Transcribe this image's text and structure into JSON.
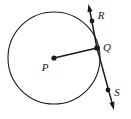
{
  "figure": {
    "name": "circle-with-tangent-line",
    "background_color": "#ffffff",
    "stroke_color": "#1a1a1a",
    "point_color": "#1a1a1a"
  },
  "circle": {
    "label": "circle-p",
    "center_x": 54,
    "center_y": 58,
    "radius": 46,
    "stroke_width": 1.1
  },
  "points": [
    {
      "id": "P",
      "label": "P",
      "role": "center",
      "x": 54,
      "y": 58,
      "label_x": 45,
      "label_y": 68,
      "dot_radius": 2.6
    },
    {
      "id": "Q",
      "label": "Q",
      "role": "point-of-tangency",
      "x": 97,
      "y": 48,
      "label_x": 107,
      "label_y": 48,
      "dot_radius": 2.8
    },
    {
      "id": "R",
      "label": "R",
      "role": "tangent-point-upper",
      "x": 92,
      "y": 21,
      "label_x": 101,
      "label_y": 16,
      "dot_radius": 2.4
    },
    {
      "id": "S",
      "label": "S",
      "role": "tangent-point-lower",
      "x": 108,
      "y": 90,
      "label_x": 117,
      "label_y": 93,
      "dot_radius": 2.4
    }
  ],
  "segments": [
    {
      "id": "radius-PQ",
      "label": "radius",
      "from": "P",
      "to": "Q",
      "x1": 54,
      "y1": 58,
      "x2": 97,
      "y2": 48,
      "stroke_width": 1.6
    }
  ],
  "rays": [
    {
      "id": "ray-Q-to-R",
      "label": "upper tangent ray",
      "x1": 97,
      "y1": 48,
      "x2": 88.5,
      "y2": 4,
      "stroke_width": 1.5,
      "arrow": "end"
    },
    {
      "id": "ray-Q-to-S",
      "label": "lower tangent ray",
      "x1": 97,
      "y1": 48,
      "x2": 114,
      "y2": 110,
      "stroke_width": 1.5,
      "arrow": "end"
    }
  ],
  "arrowheads": [
    {
      "id": "arrowhead-upper",
      "tip_x": 88.5,
      "tip_y": 4,
      "angle_deg": 259
    },
    {
      "id": "arrowhead-lower",
      "tip_x": 114,
      "tip_y": 110,
      "angle_deg": 74.6
    }
  ],
  "labels": {
    "P": "P",
    "Q": "Q",
    "R": "R",
    "S": "S"
  }
}
